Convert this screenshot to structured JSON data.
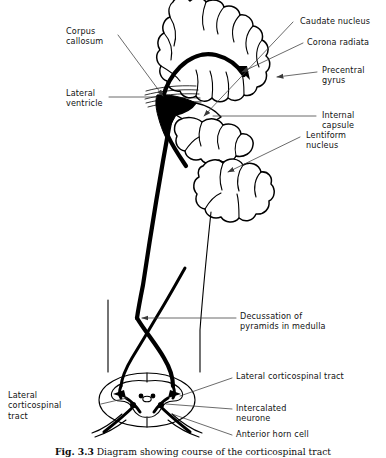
{
  "figure": {
    "title": "Diagram showing course of the corticospinal tract",
    "caption_number": "Fig. 3.3",
    "caption_text": "Diagram showing course of the corticospinal tract",
    "background_color": "#ffffff",
    "ink_color": "#000000",
    "leader_color": "#3a3a3a"
  },
  "labels": {
    "corpus_callosum": "Corpus\ncallosum",
    "lateral_ventricle": "Lateral\nventricle",
    "caudate_nucleus": "Caudate nucleus",
    "corona_radiata": "Corona radiata",
    "precentral_gyrus": "Precentral\ngyrus",
    "internal_capsule": "Internal\ncapsule",
    "lentiform_nucleus": "Lentiform\nnucleus",
    "decussation": "Decussation of\npyramids in medulla",
    "lateral_corticospinal_tract_right": "Lateral corticospinal tract",
    "lateral_corticospinal_tract_left": "Lateral\ncorticospinal\ntract",
    "intercalated_neurone": "Intercalated\nneurone",
    "anterior_horn_cell": "Anterior horn cell"
  },
  "structures": [
    {
      "name": "cerebral-hemisphere",
      "kind": "outline"
    },
    {
      "name": "corpus-callosum-fibres",
      "kind": "fibres"
    },
    {
      "name": "lateral-ventricle",
      "kind": "filled-black"
    },
    {
      "name": "caudate-nucleus",
      "kind": "stippled"
    },
    {
      "name": "lentiform-nucleus",
      "kind": "stippled"
    },
    {
      "name": "internal-capsule",
      "kind": "gap"
    },
    {
      "name": "brainstem",
      "kind": "outline-thin"
    },
    {
      "name": "corticospinal-tract",
      "kind": "thick-line"
    },
    {
      "name": "pyramidal-decussation",
      "kind": "crossing"
    },
    {
      "name": "spinal-cord-cross-section",
      "kind": "outline-thin"
    },
    {
      "name": "grey-matter-butterfly",
      "kind": "outline-thin"
    },
    {
      "name": "anterior-horn-cell",
      "kind": "neuron"
    },
    {
      "name": "intercalated-neurone",
      "kind": "neuron"
    }
  ]
}
